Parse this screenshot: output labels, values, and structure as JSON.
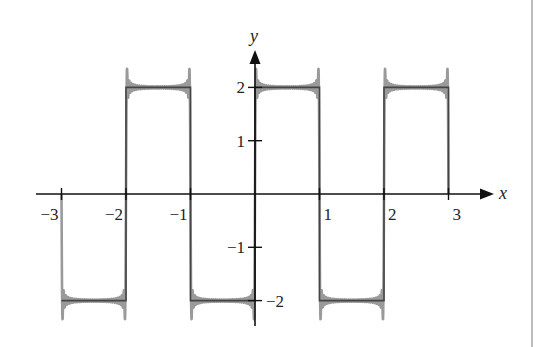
{
  "chart_data": {
    "type": "line",
    "title": "",
    "xlabel": "x",
    "ylabel": "y",
    "xlim": [
      -3,
      3
    ],
    "ylim": [
      -2.5,
      2.5
    ],
    "grid": false,
    "legend": null,
    "x_ticks": [
      -3,
      -2,
      -1,
      1,
      2,
      3
    ],
    "x_tick_labels": [
      "−3",
      "−2",
      "−1",
      "1",
      "2",
      "3"
    ],
    "y_ticks": [
      2,
      1,
      -1,
      -2
    ],
    "y_tick_labels": [
      "2",
      "1",
      "−1",
      "−2"
    ],
    "series": [
      {
        "name": "square wave f(x)",
        "style": "dark gray solid",
        "color": "#444444",
        "x": [
          -3,
          -2,
          -2,
          -1,
          -1,
          0,
          0,
          1,
          1,
          2,
          2,
          3,
          3
        ],
        "y": [
          -2,
          -2,
          2,
          2,
          -2,
          -2,
          2,
          2,
          -2,
          -2,
          2,
          2,
          0
        ]
      },
      {
        "name": "Fourier partial sum (Gibbs overshoot)",
        "style": "light gray, overshoot spikes at discontinuities",
        "color": "#9a9a9a",
        "overshoot_peak": 2.3,
        "note": "approximates square wave; spikes of ~±2.3 near each jump at x = -3,-2,-1,0,1,2,3"
      }
    ],
    "annotations": []
  },
  "colors": {
    "axis": "#111111",
    "wave": "#444444",
    "approx": "#9a9a9a",
    "border": "#bdbdbd",
    "background": "#ffffff"
  }
}
